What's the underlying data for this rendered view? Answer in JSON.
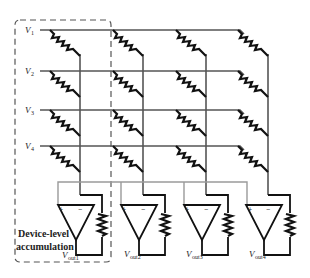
{
  "diagram": {
    "inputs": [
      {
        "label": "V",
        "sub": "1"
      },
      {
        "label": "V",
        "sub": "2"
      },
      {
        "label": "V",
        "sub": "3"
      },
      {
        "label": "V",
        "sub": "4"
      }
    ],
    "outputs": [
      {
        "label": "V",
        "sub": "out1"
      },
      {
        "label": "V",
        "sub": "out2"
      },
      {
        "label": "V",
        "sub": "out3"
      },
      {
        "label": "V",
        "sub": "out4"
      }
    ],
    "annotation": {
      "line1": "Device-level",
      "line2": "accumulation"
    },
    "opamp_signs": {
      "plus": "+",
      "minus": "−"
    },
    "colors": {
      "wire": "#555555",
      "bus": "#9a9a9a",
      "component": "#111111",
      "background": "#ffffff"
    }
  }
}
